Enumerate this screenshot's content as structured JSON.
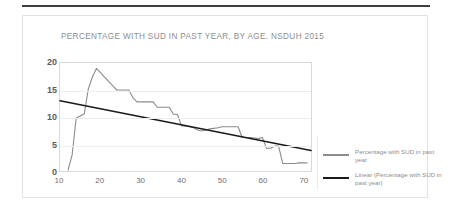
{
  "card": {
    "title": "PERCENTAGE WITH SUD IN PAST YEAR, BY AGE. NSDUH 2015"
  },
  "colors": {
    "series_line": "#8c8c8c",
    "trend_line": "#1a1a1a",
    "axis": "#d9d9d9",
    "grid": "#ededed",
    "title_text": "#8d8d8d",
    "tick_text": "#5b5b5b",
    "top_rule": "#3d3d3d"
  },
  "legend": {
    "items": [
      {
        "label": "Percentage with SUD in past year",
        "color": "#8c8c8c",
        "name": "series"
      },
      {
        "label": "Linear (Percentage with SUD in past year)",
        "color": "#1a1a1a",
        "name": "trendline"
      }
    ]
  },
  "chart_data": {
    "type": "line",
    "title": "PERCENTAGE WITH SUD IN PAST YEAR, BY AGE. NSDUH 2015",
    "xlabel": "",
    "ylabel": "",
    "xlim": [
      10,
      72
    ],
    "ylim": [
      0,
      20
    ],
    "grid": true,
    "legend_position": "right",
    "xticks": [
      10,
      20,
      30,
      40,
      50,
      60,
      70
    ],
    "yticks": [
      0,
      5,
      10,
      15,
      20
    ],
    "series": [
      {
        "name": "Percentage with SUD in past year",
        "type": "line",
        "color": "#8c8c8c",
        "x": [
          12,
          13,
          14,
          15,
          16,
          17,
          18,
          19,
          20,
          21,
          22,
          23,
          24,
          25,
          26,
          27,
          28,
          29,
          30,
          31,
          32,
          33,
          34,
          35,
          36,
          37,
          38,
          39,
          40,
          41,
          42,
          43,
          44,
          45,
          46,
          47,
          48,
          49,
          50,
          51,
          52,
          53,
          54,
          55,
          56,
          57,
          58,
          59,
          60,
          61,
          62,
          63,
          64,
          65,
          66,
          67,
          68,
          69,
          70,
          71
        ],
        "y": [
          0.2,
          3.0,
          9.8,
          10.2,
          10.6,
          15.2,
          17.4,
          19.0,
          18.2,
          17.4,
          16.6,
          15.8,
          15.0,
          15.0,
          15.0,
          15.0,
          13.6,
          12.8,
          12.8,
          12.8,
          12.8,
          12.8,
          11.8,
          11.8,
          11.8,
          11.8,
          10.5,
          10.5,
          8.4,
          8.3,
          8.2,
          8.0,
          7.6,
          7.4,
          7.6,
          7.8,
          7.9,
          8.0,
          8.2,
          8.2,
          8.2,
          8.2,
          8.2,
          6.2,
          6.2,
          6.2,
          6.1,
          6.0,
          6.2,
          4.2,
          4.2,
          4.6,
          4.6,
          1.4,
          1.4,
          1.4,
          1.4,
          1.5,
          1.5,
          1.5
        ]
      },
      {
        "name": "Linear (Percentage with SUD in past year)",
        "type": "trendline",
        "color": "#1a1a1a",
        "x": [
          10,
          72
        ],
        "y": [
          13.0,
          3.8
        ]
      }
    ]
  }
}
